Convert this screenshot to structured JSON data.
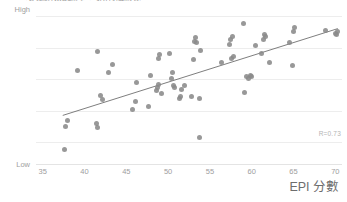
{
  "chart_title": "環境績效指數與人均所得之關係",
  "x_axis_title": "EPI 分數",
  "y_axis_high_label": "High",
  "y_axis_low_label": "Low",
  "correlation_annotation": "R=0.73",
  "x_tick_labels": [
    "35",
    "40",
    "45",
    "50",
    "55",
    "60",
    "65",
    "70"
  ],
  "colors": {
    "point": "#8a8a8a",
    "gridline": "#ededed",
    "trendline": "#6f6f6f",
    "tick_text": "#9e9e9e",
    "axis_title_text": "#6d6d6d",
    "annotation_text": "#b4b4b4",
    "background": "#ffffff"
  },
  "chart_data": {
    "type": "scatter",
    "title": "環境績效指數與人均所得之關係",
    "xlabel": "EPI 分數",
    "ylabel": "",
    "xlim": [
      34.2,
      70.8
    ],
    "ylim": [
      0,
      100
    ],
    "grid": true,
    "legend": null,
    "x_ticks": [
      35,
      40,
      45,
      50,
      55,
      60,
      65,
      70
    ],
    "y_ticks": [],
    "y_tick_labels": [
      "Low",
      "High"
    ],
    "annotations": [
      {
        "text": "R=0.73",
        "x": 69.5,
        "y": 9
      }
    ],
    "series": [
      {
        "name": "Countries",
        "marker": "circle",
        "color": "#8a8a8a",
        "points": [
          [
            37.6,
            10
          ],
          [
            37.7,
            25
          ],
          [
            38.0,
            29
          ],
          [
            39.2,
            61
          ],
          [
            41.4,
            27
          ],
          [
            41.5,
            24
          ],
          [
            41.6,
            73
          ],
          [
            41.9,
            45
          ],
          [
            42.2,
            42
          ],
          [
            42.9,
            60
          ],
          [
            43.4,
            65
          ],
          [
            45.8,
            36
          ],
          [
            46.1,
            41
          ],
          [
            46.2,
            53
          ],
          [
            47.7,
            38
          ],
          [
            47.9,
            58
          ],
          [
            48.6,
            48
          ],
          [
            48.7,
            50
          ],
          [
            48.8,
            52
          ],
          [
            48.9,
            69
          ],
          [
            49.0,
            71
          ],
          [
            49.2,
            46
          ],
          [
            50.2,
            72
          ],
          [
            50.4,
            56
          ],
          [
            50.5,
            60
          ],
          [
            50.6,
            51
          ],
          [
            50.8,
            50
          ],
          [
            51.4,
            43
          ],
          [
            51.5,
            44
          ],
          [
            51.6,
            49
          ],
          [
            52.0,
            51
          ],
          [
            52.8,
            44
          ],
          [
            53.0,
            68
          ],
          [
            53.2,
            80
          ],
          [
            53.3,
            82
          ],
          [
            53.4,
            79
          ],
          [
            53.7,
            43
          ],
          [
            53.8,
            18
          ],
          [
            53.9,
            74
          ],
          [
            56.4,
            66
          ],
          [
            57.3,
            78
          ],
          [
            57.5,
            81
          ],
          [
            57.6,
            69
          ],
          [
            57.7,
            83
          ],
          [
            57.8,
            70
          ],
          [
            59.0,
            91
          ],
          [
            59.1,
            47
          ],
          [
            59.4,
            57
          ],
          [
            59.6,
            56
          ],
          [
            59.8,
            58
          ],
          [
            60.0,
            57
          ],
          [
            60.4,
            77
          ],
          [
            61.2,
            72
          ],
          [
            61.4,
            81
          ],
          [
            61.5,
            84
          ],
          [
            61.6,
            83
          ],
          [
            62.1,
            66
          ],
          [
            64.5,
            79
          ],
          [
            64.9,
            64
          ],
          [
            65.0,
            86
          ],
          [
            65.1,
            89
          ],
          [
            68.8,
            87
          ],
          [
            70.0,
            85
          ],
          [
            70.2,
            84
          ],
          [
            70.3,
            86
          ]
        ]
      }
    ],
    "trendline": {
      "type": "linear",
      "x_start": 37.4,
      "y_start": 32,
      "x_end": 70.3,
      "y_end": 88,
      "r": 0.73
    }
  }
}
